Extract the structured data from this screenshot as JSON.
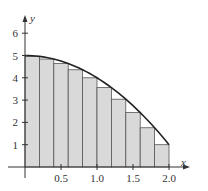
{
  "chart_data": {
    "type": "bar",
    "title": "",
    "function": "y = 5 - x^2",
    "xlabel": "x",
    "ylabel": "y",
    "xlim": [
      0,
      2.0
    ],
    "ylim": [
      0,
      6
    ],
    "x_ticks": [
      "0.5",
      "1.0",
      "1.5",
      "2.0"
    ],
    "y_ticks": [
      "1",
      "2",
      "3",
      "4",
      "5",
      "6"
    ],
    "grid": false,
    "legend": null,
    "bar_width": 0.2,
    "categories": [
      "0.0-0.2",
      "0.2-0.4",
      "0.4-0.6",
      "0.6-0.8",
      "0.8-1.0",
      "1.0-1.2",
      "1.2-1.4",
      "1.4-1.6",
      "1.6-1.8",
      "1.8-2.0"
    ],
    "x_left": [
      0.0,
      0.2,
      0.4,
      0.6,
      0.8,
      1.0,
      1.2,
      1.4,
      1.6,
      1.8
    ],
    "values": [
      4.96,
      4.84,
      4.64,
      4.36,
      4.0,
      3.56,
      3.04,
      2.44,
      1.76,
      1.0
    ],
    "curve_points": [
      [
        0,
        5
      ],
      [
        0.2,
        4.96
      ],
      [
        0.4,
        4.84
      ],
      [
        0.6,
        4.64
      ],
      [
        0.8,
        4.36
      ],
      [
        1.0,
        4.0
      ],
      [
        1.2,
        3.56
      ],
      [
        1.4,
        3.04
      ],
      [
        1.6,
        2.44
      ],
      [
        1.8,
        1.76
      ],
      [
        2.0,
        1.0
      ]
    ]
  },
  "colors": {
    "bar_fill": "#d9d9d9",
    "bar_stroke": "#555555",
    "curve": "#222222",
    "axis": "#333333"
  }
}
